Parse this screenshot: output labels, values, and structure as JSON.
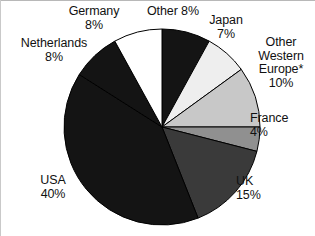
{
  "chart_data": {
    "type": "pie",
    "title": "",
    "subtitle": "",
    "xlabel": "",
    "ylabel": "",
    "legend_position": "labels-around-pie",
    "grid": false,
    "units": "percent",
    "start_angle_deg": 0,
    "direction": "clockwise",
    "center": {
      "x": 162,
      "y": 127
    },
    "radius": 98,
    "categories": [
      "Other",
      "Japan",
      "Other Western Europe*",
      "France",
      "UK",
      "USA",
      "Netherlands",
      "Germany"
    ],
    "values": [
      8,
      7,
      10,
      4,
      15,
      40,
      8,
      8
    ],
    "slices": [
      {
        "name": "Other",
        "value": 8,
        "label_line1": "Other 8%",
        "label_line2": "",
        "color": "#141414",
        "stroke": "#000000"
      },
      {
        "name": "Japan",
        "value": 7,
        "label_line1": "Japan",
        "label_line2": "7%",
        "color": "#eeeeee",
        "stroke": "#000000"
      },
      {
        "name": "Other Western Europe*",
        "value": 10,
        "label_line1": "Other",
        "label_line2": "Western",
        "label_line3": "Europe*",
        "label_line4": "10%",
        "color": "#c8c8c8",
        "stroke": "#000000"
      },
      {
        "name": "France",
        "value": 4,
        "label_line1": "France",
        "label_line2": "4%",
        "color": "#909090",
        "stroke": "#000000"
      },
      {
        "name": "UK",
        "value": 15,
        "label_line1": "UK",
        "label_line2": "15%",
        "color": "#3a3a3a",
        "stroke": "#000000"
      },
      {
        "name": "USA",
        "value": 40,
        "label_line1": "USA",
        "label_line2": "40%",
        "color": "#141414",
        "stroke": "#000000"
      },
      {
        "name": "Netherlands",
        "value": 8,
        "label_line1": "Netherlands",
        "label_line2": "8%",
        "color": "#141414",
        "stroke": "#000000"
      },
      {
        "name": "Germany",
        "value": 8,
        "label_line1": "Germany",
        "label_line2": "8%",
        "color": "#ffffff",
        "stroke": "#000000"
      }
    ]
  },
  "labels": {
    "germany": "Germany\n8%",
    "other": "Other 8%",
    "japan": "Japan\n7%",
    "netherlands": "Netherlands\n8%",
    "other_western_europe": "Other\nWestern\nEurope*\n10%",
    "france": "France\n4%",
    "uk": "UK\n15%",
    "usa": "USA\n40%"
  }
}
